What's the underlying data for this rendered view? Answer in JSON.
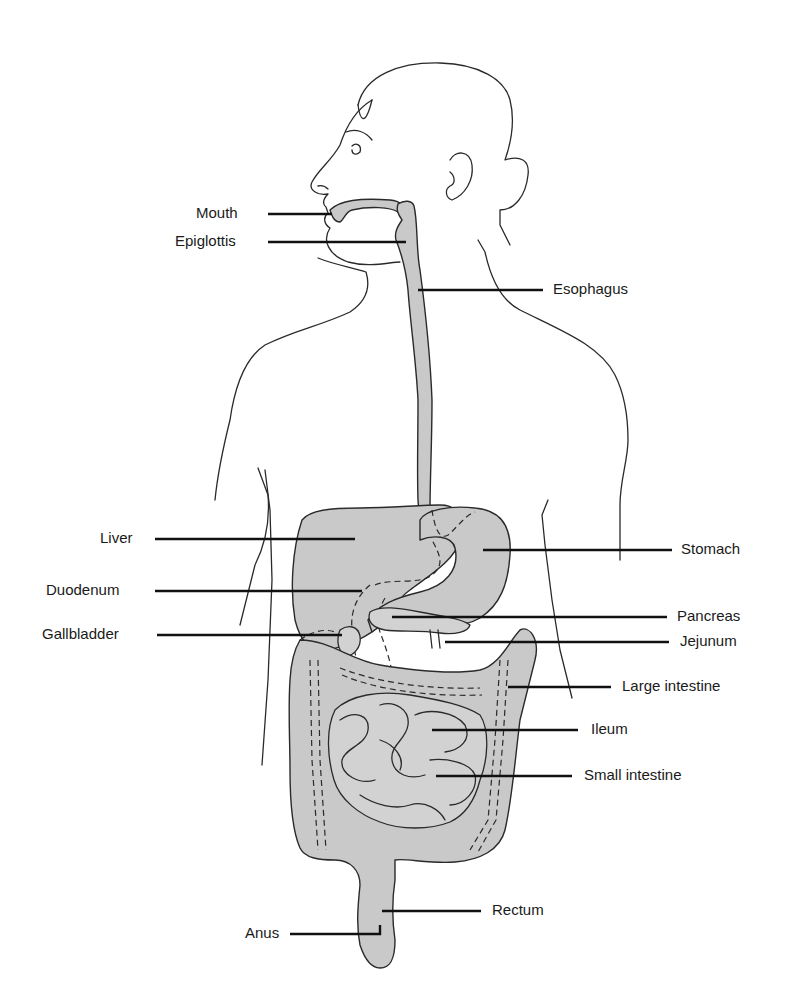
{
  "diagram": {
    "labels": {
      "mouth": "Mouth",
      "epiglottis": "Epiglottis",
      "esophagus": "Esophagus",
      "liver": "Liver",
      "stomach": "Stomach",
      "duodenum": "Duodenum",
      "pancreas": "Pancreas",
      "gallbladder": "Gallbladder",
      "jejunum": "Jejunum",
      "large_intestine": "Large intestine",
      "ileum": "Ileum",
      "small_intestine": "Small intestine",
      "rectum": "Rectum",
      "anus": "Anus"
    },
    "colors": {
      "organ_fill": "#c9c9c9",
      "outline": "#2a2a2a",
      "leader": "#111111",
      "background": "#ffffff"
    }
  }
}
